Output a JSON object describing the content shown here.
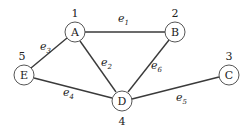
{
  "diagram": {
    "type": "weighted-graph",
    "nodes": [
      {
        "id": "A",
        "label": "A",
        "weight": "1",
        "x": 75,
        "y": 32
      },
      {
        "id": "B",
        "label": "B",
        "weight": "2",
        "x": 175,
        "y": 32
      },
      {
        "id": "C",
        "label": "C",
        "weight": "3",
        "x": 229,
        "y": 75
      },
      {
        "id": "D",
        "label": "D",
        "weight": "4",
        "x": 122,
        "y": 101
      },
      {
        "id": "E",
        "label": "E",
        "weight": "5",
        "x": 24,
        "y": 75
      }
    ],
    "edges": [
      {
        "id": "e1",
        "base": "e",
        "sub": "1",
        "from": "A",
        "to": "B"
      },
      {
        "id": "e2",
        "base": "e",
        "sub": "2",
        "from": "A",
        "to": "D"
      },
      {
        "id": "e3",
        "base": "e",
        "sub": "3",
        "from": "A",
        "to": "E"
      },
      {
        "id": "e4",
        "base": "e",
        "sub": "4",
        "from": "E",
        "to": "D"
      },
      {
        "id": "e5",
        "base": "e",
        "sub": "5",
        "from": "D",
        "to": "C"
      },
      {
        "id": "e6",
        "base": "e",
        "sub": "6",
        "from": "B",
        "to": "D"
      }
    ]
  }
}
